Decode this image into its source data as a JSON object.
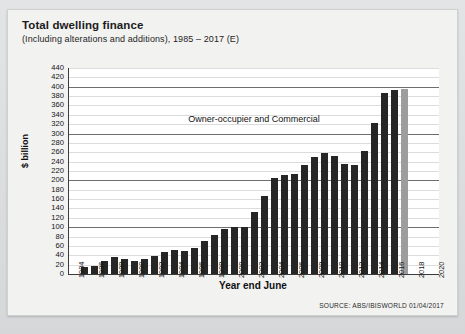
{
  "card": {
    "title": "Total dwelling finance",
    "subtitle": "(Including alterations and additions), 1985 – 2017 (E)",
    "source": "SOURCE: ABS/IBISWORLD 01/04/2017"
  },
  "colors": {
    "bar": "#262626",
    "bar_estimate": "#9d9d9d",
    "axis": "#3b3b3b",
    "gridline": "#dcdcdc",
    "gridline_major": "#6e6e6e",
    "plot_background": "#ffffff",
    "card_background": "#f2f2f1",
    "page_background": "#d9dadb"
  },
  "chart_data": {
    "type": "bar",
    "title": "Total dwelling finance",
    "subtitle": "(Including alterations and additions), 1985 – 2017 (E)",
    "xlabel": "Year end June",
    "ylabel": "$ billion",
    "ylim": [
      0,
      440
    ],
    "ytick_step": 20,
    "yticks": [
      0,
      20,
      40,
      60,
      80,
      100,
      120,
      140,
      160,
      180,
      200,
      220,
      240,
      260,
      280,
      300,
      320,
      340,
      360,
      380,
      400,
      420,
      440
    ],
    "major_gridlines": [
      100,
      200,
      300,
      400
    ],
    "grid": true,
    "legend": "none",
    "annotations": [
      {
        "text": "Owner-occupier and Commercial",
        "x": 2000,
        "y": 330
      }
    ],
    "x_axis_ticks": [
      1984,
      1986,
      1988,
      1990,
      1992,
      1994,
      1996,
      1998,
      2000,
      2002,
      2004,
      2006,
      2008,
      2010,
      2012,
      2014,
      2016,
      2018,
      2020
    ],
    "x_domain": [
      1983.5,
      2020.5
    ],
    "categories": [
      1985,
      1986,
      1987,
      1988,
      1989,
      1990,
      1991,
      1992,
      1993,
      1994,
      1995,
      1996,
      1997,
      1998,
      1999,
      2000,
      2001,
      2002,
      2003,
      2004,
      2005,
      2006,
      2007,
      2008,
      2009,
      2010,
      2011,
      2012,
      2013,
      2014,
      2015,
      2016,
      2017
    ],
    "values": [
      14,
      18,
      28,
      36,
      32,
      28,
      32,
      38,
      46,
      52,
      50,
      56,
      70,
      84,
      96,
      100,
      100,
      133,
      167,
      206,
      212,
      214,
      232,
      250,
      258,
      252,
      236,
      232,
      263,
      322,
      386,
      393,
      395
    ],
    "estimate_categories": [
      2017
    ],
    "series": [
      {
        "name": "Owner-occupier and Commercial",
        "values": [
          14,
          18,
          28,
          36,
          32,
          28,
          32,
          38,
          46,
          52,
          50,
          56,
          70,
          84,
          96,
          100,
          100,
          133,
          167,
          206,
          212,
          214,
          232,
          250,
          258,
          252,
          236,
          232,
          263,
          322,
          386,
          393,
          395
        ]
      }
    ]
  }
}
